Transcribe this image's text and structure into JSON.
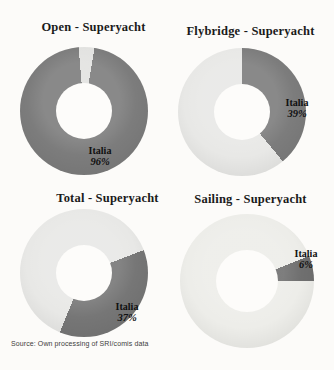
{
  "figure": {
    "source_note": "Source: Own processing of SRI/comis data",
    "accent_dark": "#7c7c7c",
    "accent_light": "#e8e8e6",
    "background": "#fcfbf9"
  },
  "chart_data": [
    {
      "type": "pie",
      "subtype": "donut",
      "title": "Open - Superyacht",
      "rotate": 9.5,
      "legend": "none",
      "slices": [
        {
          "label": "Italia",
          "value": 96,
          "color": "#7c7c7c"
        },
        {
          "label": "",
          "value": 4,
          "color": "#e2e2e0"
        }
      ],
      "callout": {
        "name": "Italia",
        "pct": "96%"
      }
    },
    {
      "type": "pie",
      "subtype": "donut",
      "title": "Flybridge - Superyacht",
      "rotate": 0,
      "legend": "none",
      "slices": [
        {
          "label": "Italia",
          "value": 39,
          "color": "#7c7c7c"
        },
        {
          "label": "",
          "value": 61,
          "color": "#e8e8e6"
        }
      ],
      "callout": {
        "name": "Italia",
        "pct": "39%"
      }
    },
    {
      "type": "pie",
      "subtype": "donut",
      "title": "Total - Superyacht",
      "rotate": 69,
      "legend": "none",
      "slices": [
        {
          "label": "Italia",
          "value": 37,
          "color": "#767676"
        },
        {
          "label": "",
          "value": 63,
          "color": "#e8e8e6"
        }
      ],
      "callout": {
        "name": "Italia",
        "pct": "37%"
      }
    },
    {
      "type": "pie",
      "subtype": "donut",
      "title": "Sailing - Superyacht",
      "rotate": 68,
      "legend": "none",
      "slices": [
        {
          "label": "Italia",
          "value": 6,
          "color": "#6f6f6f"
        },
        {
          "label": "",
          "value": 94,
          "color": "#edede9"
        }
      ],
      "callout": {
        "name": "Italia",
        "pct": "6%"
      }
    }
  ]
}
